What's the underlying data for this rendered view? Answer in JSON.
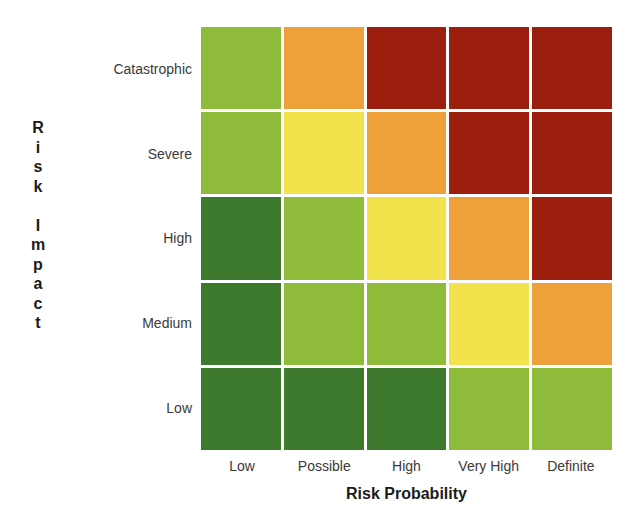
{
  "chart_data": {
    "type": "heatmap",
    "title": "",
    "xlabel": "Risk Probability",
    "ylabel": "Risk Impact",
    "x_categories": [
      "Low",
      "Possible",
      "High",
      "Very High",
      "Definite"
    ],
    "y_categories": [
      "Catastrophic",
      "Severe",
      "High",
      "Medium",
      "Low"
    ],
    "levels": {
      "dark_green": "#3d7a2e",
      "light_green": "#8fbb3a",
      "yellow": "#f2e34c",
      "orange": "#eea03a",
      "red": "#9b1e0e"
    },
    "matrix": [
      [
        "light_green",
        "orange",
        "red",
        "red",
        "red"
      ],
      [
        "light_green",
        "yellow",
        "orange",
        "red",
        "red"
      ],
      [
        "dark_green",
        "light_green",
        "yellow",
        "orange",
        "red"
      ],
      [
        "dark_green",
        "light_green",
        "light_green",
        "yellow",
        "orange"
      ],
      [
        "dark_green",
        "dark_green",
        "dark_green",
        "light_green",
        "light_green"
      ]
    ],
    "grid": false,
    "legend": "none"
  },
  "axis": {
    "y_title_letters": [
      "R",
      "i",
      "s",
      "k",
      "",
      "I",
      "m",
      "p",
      "a",
      "c",
      "t"
    ],
    "x_title": "Risk Probability"
  }
}
